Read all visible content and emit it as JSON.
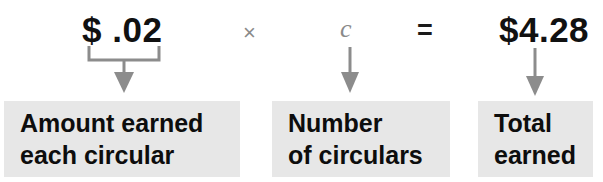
{
  "diagram": {
    "colors": {
      "box_background": "#e7e7e7",
      "text": "#0d0d0d",
      "operator_gray": "#8a8a8a",
      "connector_gray": "#8c8c8c",
      "page_background": "#ffffff"
    },
    "equation": {
      "factor1": "$ .02",
      "operator1": "×",
      "factor2": "c",
      "operator2": "=",
      "product": "$4.28"
    },
    "connectors": [
      {
        "name": "brace-to-amount",
        "type": "brace-arrow"
      },
      {
        "name": "arrow-to-number",
        "type": "straight-arrow"
      },
      {
        "name": "arrow-to-total",
        "type": "straight-arrow"
      }
    ],
    "labels": [
      {
        "name": "amount-earned",
        "line1": "Amount earned",
        "line2": "each circular"
      },
      {
        "name": "number-of-circulars",
        "line1": "Number",
        "line2": "of circulars"
      },
      {
        "name": "total-earned",
        "line1": "Total",
        "line2": "earned"
      }
    ]
  }
}
